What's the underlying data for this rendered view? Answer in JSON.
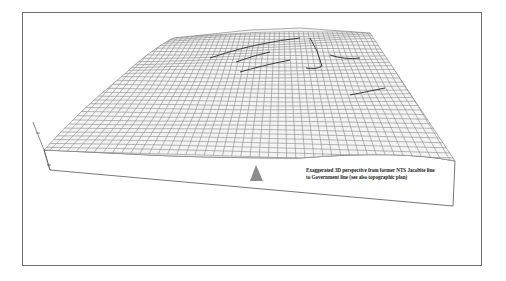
{
  "figure": {
    "caption_line1": "Exaggerated 3D perspective from former NTS Jacobite line",
    "caption_line2": "to Government line (see also topographic plan)",
    "marker": "triangle-viewpoint-marker",
    "colors": {
      "mesh": "#8a8a8a",
      "mesh_dark": "#3c3c3c",
      "frame": "#6e6e6e",
      "marker": "#8c8c8c",
      "background": "#ffffff"
    }
  }
}
